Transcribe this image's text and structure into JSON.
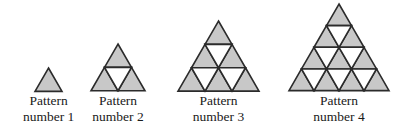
{
  "figure": {
    "name": "triangular-number-pattern-sequence",
    "background_color": "#ffffff",
    "width": 396,
    "height": 124
  },
  "style": {
    "shaded_fill": "#c8c8c8",
    "unshaded_fill": "#ffffff",
    "stroke_color": "#2b2b2b",
    "text_color": "#1a1a1a",
    "stroke_width": 1.6
  },
  "chart_data": {
    "type": "diagram",
    "title": "",
    "patterns": [
      {
        "index": 1,
        "rows": 1,
        "up_triangles": 1,
        "down_triangles": 0,
        "total_triangles": 1,
        "caption_line1": "Pattern",
        "caption_line2": "number 1",
        "left": 23,
        "unit": 27
      },
      {
        "index": 2,
        "rows": 2,
        "up_triangles": 3,
        "down_triangles": 1,
        "total_triangles": 4,
        "caption_line1": "Pattern",
        "caption_line2": "number 2",
        "left": 91,
        "unit": 27
      },
      {
        "index": 3,
        "rows": 3,
        "up_triangles": 6,
        "down_triangles": 3,
        "total_triangles": 9,
        "caption_line1": "Pattern",
        "caption_line2": "number 3",
        "left": 178,
        "unit": 27
      },
      {
        "index": 4,
        "rows": 4,
        "up_triangles": 10,
        "down_triangles": 6,
        "total_triangles": 16,
        "caption_line1": "Pattern",
        "caption_line2": "number 4",
        "left": 289,
        "unit": 25
      }
    ]
  }
}
